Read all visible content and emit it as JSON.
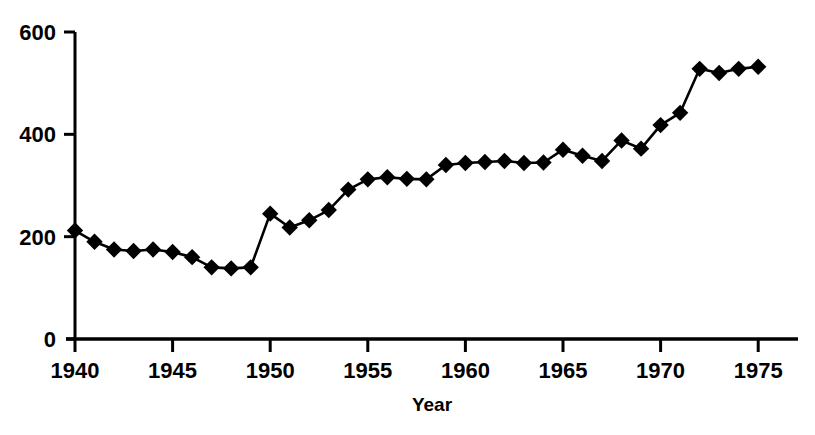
{
  "chart_data": {
    "type": "line",
    "title": "",
    "subtitle": "",
    "xlabel": "Year",
    "ylabel": "",
    "grid": false,
    "legend": "none",
    "marker": "diamond",
    "marker_color": "#000000",
    "line_color": "#000000",
    "xlim": [
      1939.2,
      1976.0
    ],
    "ylim": [
      0,
      600
    ],
    "xticks": [
      1940,
      1945,
      1950,
      1955,
      1960,
      1965,
      1970,
      1975
    ],
    "xtick_labels": [
      "1940",
      "1945",
      "1950",
      "1955",
      "1960",
      "1965",
      "1970",
      "1975"
    ],
    "yticks": [
      0,
      200,
      400,
      600
    ],
    "ytick_labels": [
      "0",
      "200",
      "400",
      "600"
    ],
    "x": [
      1940,
      1941,
      1942,
      1943,
      1944,
      1945,
      1946,
      1947,
      1948,
      1949,
      1950,
      1951,
      1952,
      1953,
      1954,
      1955,
      1956,
      1957,
      1958,
      1959,
      1960,
      1961,
      1962,
      1963,
      1964,
      1965,
      1966,
      1967,
      1968,
      1969,
      1970,
      1971,
      1972,
      1973,
      1974,
      1975
    ],
    "values": [
      212,
      190,
      175,
      172,
      175,
      170,
      160,
      140,
      138,
      140,
      245,
      218,
      232,
      252,
      292,
      312,
      316,
      313,
      312,
      340,
      344,
      346,
      348,
      344,
      345,
      370,
      358,
      348,
      388,
      372,
      418,
      442,
      528,
      520,
      528,
      532
    ],
    "series": [
      {
        "name": "series-1",
        "values": [
          212,
          190,
          175,
          172,
          175,
          170,
          160,
          140,
          138,
          140,
          245,
          218,
          232,
          252,
          292,
          312,
          316,
          313,
          312,
          340,
          344,
          346,
          348,
          344,
          345,
          370,
          358,
          348,
          388,
          372,
          418,
          442,
          528,
          520,
          528,
          532
        ]
      }
    ]
  },
  "axes": {
    "x_title": "Year",
    "y_title": ""
  }
}
